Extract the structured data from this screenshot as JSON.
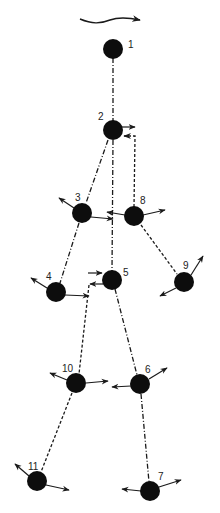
{
  "diagram": {
    "type": "skeleton-kinematic-chain",
    "colors": {
      "node": "#0d0d0d",
      "line": "#1a1a1a",
      "background": "#ffffff"
    },
    "motion_arrow": {
      "direction": "right"
    },
    "nodes": [
      {
        "id": "1",
        "label": "1",
        "x": 113,
        "y": 49
      },
      {
        "id": "2",
        "label": "2",
        "x": 113,
        "y": 130
      },
      {
        "id": "3",
        "label": "3",
        "x": 82,
        "y": 213
      },
      {
        "id": "4",
        "label": "4",
        "x": 56,
        "y": 292
      },
      {
        "id": "5",
        "label": "5",
        "x": 112,
        "y": 280
      },
      {
        "id": "6",
        "label": "6",
        "x": 140,
        "y": 384
      },
      {
        "id": "7",
        "label": "7",
        "x": 150,
        "y": 491
      },
      {
        "id": "8",
        "label": "8",
        "x": 134,
        "y": 216
      },
      {
        "id": "9",
        "label": "9",
        "x": 184,
        "y": 282
      },
      {
        "id": "10",
        "label": "10",
        "x": 76,
        "y": 383
      },
      {
        "id": "11",
        "label": "11",
        "x": 37,
        "y": 481
      }
    ],
    "edges": [
      {
        "from": "1",
        "to": "2",
        "style": "dash-dot"
      },
      {
        "from": "2",
        "to": "3",
        "style": "dash-dot"
      },
      {
        "from": "2",
        "to": "5",
        "style": "dash-dot"
      },
      {
        "from": "2",
        "to": "8",
        "style": "dashed"
      },
      {
        "from": "3",
        "to": "4",
        "style": "dash-dot"
      },
      {
        "from": "8",
        "to": "9",
        "style": "dashed"
      },
      {
        "from": "5",
        "to": "6",
        "style": "dash-dot"
      },
      {
        "from": "5",
        "to": "10",
        "style": "dashed"
      },
      {
        "from": "6",
        "to": "7",
        "style": "dash-dot"
      },
      {
        "from": "10",
        "to": "11",
        "style": "dashed"
      }
    ]
  }
}
